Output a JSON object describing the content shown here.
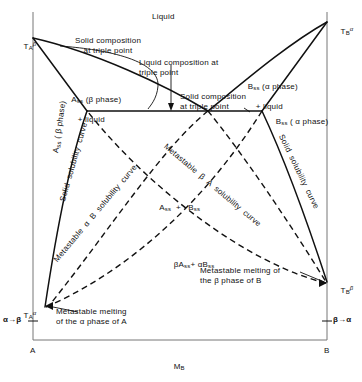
{
  "figure": {
    "type": "phase-diagram",
    "axes": {
      "x_axis_label": "M",
      "x_axis_label_sub": "B",
      "left_corner_label": "A",
      "right_corner_label": "B",
      "y_left_top_tick": {
        "main": "T",
        "sub": "A",
        "sup": "β"
      },
      "y_left_bottom_tick": {
        "main": "T",
        "sub": "A",
        "sup": "α"
      },
      "y_right_top_tick": {
        "main": "T",
        "sub": "B",
        "sup": "α"
      },
      "y_right_bottom_tick": {
        "main": "T",
        "sub": "B",
        "sup": "β"
      },
      "left_transition_label": "α→β",
      "right_transition_label": "β→α"
    },
    "regions": {
      "liquid": "Liquid",
      "a_ss_beta_plus_liquid_line1": "A",
      "a_ss_beta_plus_liquid_sub": "ss",
      "a_ss_beta_plus_liquid_line1b": " (β phase)",
      "a_ss_beta_plus_liquid_line2": "+ liquid",
      "b_ss_alpha_plus_liquid_line1": "B",
      "b_ss_alpha_plus_liquid_sub": "ss",
      "b_ss_alpha_plus_liquid_line1b": " (α phase)",
      "b_ss_alpha_plus_liquid_line2": "+ liquid",
      "b_ss_alpha_phase": "B",
      "b_ss_alpha_phase_sub": "ss",
      "b_ss_alpha_phase_rest": " ( α phase)",
      "a_ss_plus_b_ss_a": "A",
      "a_ss_plus_b_ss_a_sub": "ss",
      "a_ss_plus_b_ss_plus": "  +   ",
      "a_ss_plus_b_ss_b": "B",
      "a_ss_plus_b_ss_b_sub": "ss",
      "beta_a_ss_plus_alpha_b_ss_1": "βA",
      "beta_a_ss_plus_alpha_b_ss_1_sub": "ss",
      "beta_a_ss_plus_alpha_b_ss_mid": "+ αB",
      "beta_a_ss_plus_alpha_b_ss_2_sub": "ss"
    },
    "annotations": {
      "solid_comp_triple_left": "Solid composition\nat  triple  point",
      "liquid_comp_triple": "Liquid  composition  at\ntriple  point",
      "solid_comp_triple_right": "Solid  composition\nat  triple  point",
      "metastable_melting_alpha_A": "Metastable  melting\nof  the  α  phase  of  A",
      "metastable_melting_beta_B": "Metastable  melting  of\nthe  β  phase  of  B"
    },
    "curve_labels": {
      "a_ss_beta_phase_vertical": "A",
      "a_ss_beta_phase_vertical_sub": "ss",
      "a_ss_beta_phase_vertical_rest": " ( β phase)",
      "solid_solubility_curve_left": "Solid  solubility  curve",
      "solid_solubility_curve_right": "Solid  solubility  curve",
      "metastable_alpha_B_solubility_curve": "Metastable  α  B  solubility  curve",
      "metastable_beta_A_solubility_curve": "Metastable  β  A  solubility  curve"
    },
    "colors": {
      "line": "#111111",
      "axis": "#555555",
      "background": "#ffffff"
    },
    "geometry": {
      "plot_left": 33,
      "plot_right": 327,
      "plot_top": 12,
      "plot_bottom": 340,
      "triple_point_left_solid": {
        "x": 87,
        "y": 111
      },
      "triple_point_liquid": {
        "x": 208,
        "y": 111
      },
      "triple_point_right_solid": {
        "x": 262,
        "y": 111
      },
      "T_A_beta": {
        "x": 33,
        "y": 38
      },
      "T_B_alpha": {
        "x": 327,
        "y": 22
      },
      "T_A_alpha": {
        "x": 33,
        "y": 307
      },
      "T_B_beta": {
        "x": 327,
        "y": 282
      }
    }
  }
}
